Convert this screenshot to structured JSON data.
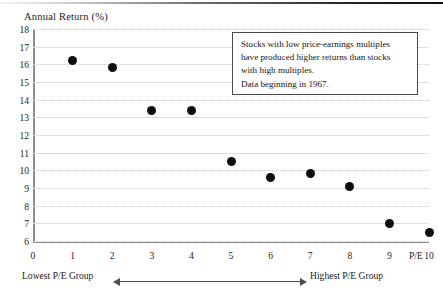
{
  "chart_data": {
    "type": "scatter",
    "title": "",
    "ylabel": "Annual Return (%)",
    "xlabel": "P/E",
    "ylim": [
      6,
      18
    ],
    "xlim": [
      0,
      10
    ],
    "grid": true,
    "legend": "none",
    "y_ticks": [
      18,
      17,
      16,
      15,
      14,
      13,
      12,
      11,
      10,
      9,
      8,
      7,
      6
    ],
    "x_ticks": [
      0,
      1,
      2,
      3,
      4,
      5,
      6,
      7,
      8,
      9,
      10
    ],
    "categories": [
      1,
      2,
      3,
      4,
      5,
      6,
      7,
      8,
      9,
      10
    ],
    "x": [
      1,
      2,
      3,
      4,
      5,
      6,
      7,
      8,
      9,
      10
    ],
    "values": [
      16.2,
      15.8,
      13.4,
      13.4,
      10.5,
      9.6,
      9.8,
      9.1,
      7.0,
      6.5
    ],
    "series": [
      {
        "name": "Annual Return by P/E decile",
        "values": [
          16.2,
          15.8,
          13.4,
          13.4,
          10.5,
          9.6,
          9.8,
          9.1,
          7.0,
          6.5
        ]
      }
    ],
    "annotations": [
      "Stocks with low price-earnings multiples",
      "have produced higher returns than stocks",
      "with high multiples.",
      "Data beginning in 1967."
    ],
    "axis_end_label": "P/E",
    "left_group_label": "Lowest P/E Group",
    "right_group_label": "Highest P/E Group",
    "marker_color": "#0d0d0d",
    "gridline_color": "#c9c9c9",
    "axis_color": "#8d8d8d"
  }
}
